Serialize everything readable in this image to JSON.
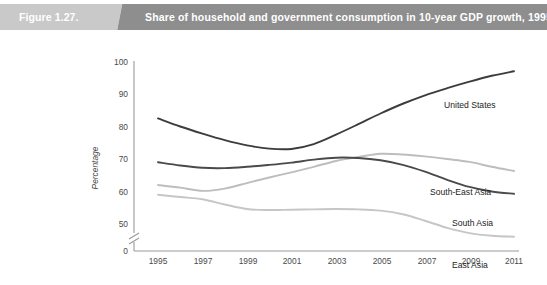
{
  "header": {
    "figure_number": "Figure 1.27.",
    "title": "Share of household and government consumption in 10-year GDP growth, 1995-2011",
    "band_left_color": "#c9c9c9",
    "band_right_color": "#8e8e8e",
    "text_color": "#ffffff"
  },
  "chart_data": {
    "type": "line",
    "title": "Share of household and government consumption in 10-year GDP growth, 1995-2011",
    "xlabel": "",
    "ylabel": "Percentage",
    "ylim": [
      50,
      100
    ],
    "y_axis_break": true,
    "y_break_value": 0,
    "yticks": [
      100,
      90,
      80,
      70,
      60,
      50,
      0
    ],
    "grid": false,
    "legend": "inline-right-labels",
    "x": [
      1995,
      1996,
      1997,
      1998,
      1999,
      2000,
      2001,
      2002,
      2003,
      2004,
      2005,
      2006,
      2007,
      2008,
      2009,
      2010,
      2011
    ],
    "xticks": [
      1995,
      1997,
      1999,
      2001,
      2003,
      2005,
      2007,
      2009,
      2011
    ],
    "series": [
      {
        "name": "United States",
        "color": "#3c3c3c",
        "width": 1.9,
        "values": [
          82.5,
          80.0,
          77.8,
          75.8,
          74.2,
          73.2,
          73.1,
          74.6,
          77.5,
          80.7,
          84.0,
          87.0,
          89.6,
          91.8,
          93.8,
          95.6,
          97.0
        ]
      },
      {
        "name": "South-East Asia",
        "color": "#bdbdbd",
        "width": 1.9,
        "values": [
          62.0,
          61.2,
          60.2,
          60.9,
          62.6,
          64.3,
          65.9,
          67.6,
          69.4,
          70.6,
          71.6,
          71.4,
          70.8,
          70.0,
          69.1,
          67.6,
          66.3
        ]
      },
      {
        "name": "South Asia",
        "color": "#4a4a4a",
        "width": 1.9,
        "values": [
          69.0,
          68.0,
          67.3,
          67.2,
          67.6,
          68.2,
          68.9,
          69.8,
          70.4,
          70.3,
          69.6,
          68.2,
          66.1,
          63.6,
          61.4,
          60.0,
          59.3
        ]
      },
      {
        "name": "East Asia",
        "color": "#c6c6c6",
        "width": 1.9,
        "values": [
          59.0,
          58.3,
          57.6,
          56.0,
          54.6,
          54.3,
          54.4,
          54.5,
          54.6,
          54.5,
          54.1,
          53.0,
          51.0,
          48.8,
          47.2,
          46.4,
          46.1
        ]
      }
    ],
    "series_label_positions": [
      {
        "name": "United States",
        "x": 444,
        "y": 68
      },
      {
        "name": "South-East Asia",
        "x": 430,
        "y": 155
      },
      {
        "name": "South Asia",
        "x": 452,
        "y": 186
      },
      {
        "name": "East Asia",
        "x": 452,
        "y": 228
      }
    ]
  }
}
